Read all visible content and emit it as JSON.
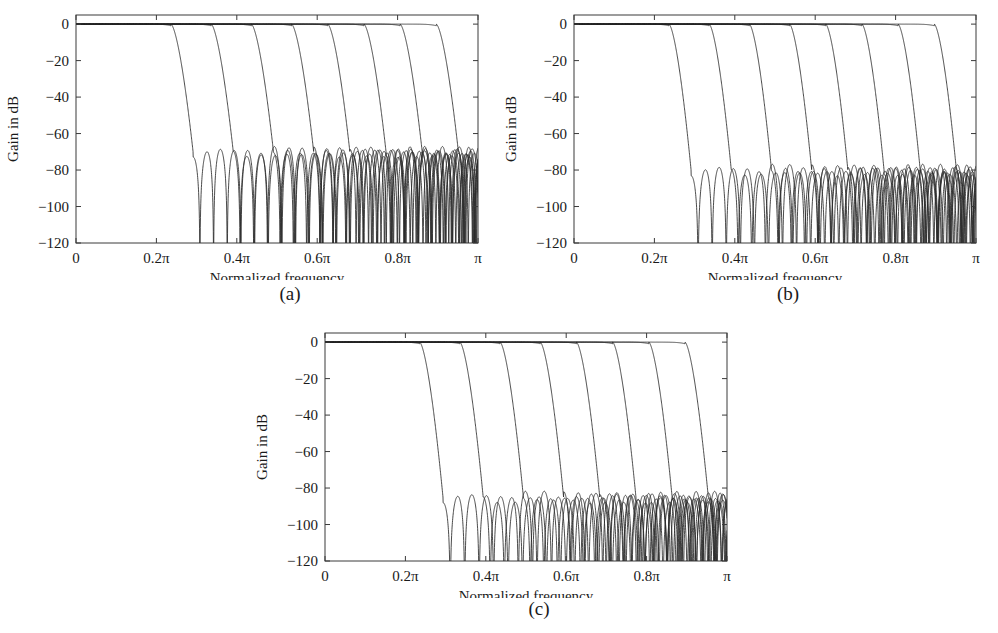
{
  "figure": {
    "background": "#ffffff",
    "line_color": "#2b2b2b",
    "axis_color": "#3a3a3a",
    "panels": [
      {
        "id": "a",
        "caption": "(a)",
        "xlabel": "Normalized frequency",
        "ylabel": "Gain in dB"
      },
      {
        "id": "b",
        "caption": "(b)",
        "xlabel": "Normalized frequency",
        "ylabel": "Gain in dB"
      },
      {
        "id": "c",
        "caption": "(c)",
        "xlabel": "Normalized frequency",
        "ylabel": "Gain in dB"
      }
    ]
  },
  "chart_data": [
    {
      "type": "line",
      "panel": "a",
      "title": "",
      "xlabel": "Normalized frequency",
      "ylabel": "Gain in dB",
      "xlim": [
        0,
        1
      ],
      "ylim": [
        -120,
        5
      ],
      "grid": false,
      "legend": "none",
      "xtick_values": [
        0,
        0.2,
        0.4,
        0.6,
        0.8,
        1.0
      ],
      "xtick_labels": [
        "0",
        "0.2π",
        "0.4π",
        "0.6π",
        "0.8π",
        "π"
      ],
      "ytick_values": [
        0,
        -20,
        -40,
        -60,
        -80,
        -100,
        -120
      ],
      "ytick_labels": [
        "0",
        "−20",
        "−40",
        "−60",
        "−80",
        "−100",
        "−120"
      ],
      "stopband_level_db": -70,
      "passband_level_db": 0,
      "n_series": 8,
      "series": [
        {
          "name": "cutoff 0.25π",
          "cutoff": 0.25,
          "transition": 0.055,
          "stopband_db": -70,
          "ripple_db": 11,
          "lobe_width": 0.034
        },
        {
          "name": "cutoff 0.35π",
          "cutoff": 0.35,
          "transition": 0.055,
          "stopband_db": -70,
          "ripple_db": 11,
          "lobe_width": 0.034
        },
        {
          "name": "cutoff 0.45π",
          "cutoff": 0.45,
          "transition": 0.055,
          "stopband_db": -70,
          "ripple_db": 11,
          "lobe_width": 0.033
        },
        {
          "name": "cutoff 0.55π",
          "cutoff": 0.55,
          "transition": 0.055,
          "stopband_db": -70,
          "ripple_db": 11,
          "lobe_width": 0.032
        },
        {
          "name": "cutoff 0.64π",
          "cutoff": 0.64,
          "transition": 0.055,
          "stopband_db": -70,
          "ripple_db": 11,
          "lobe_width": 0.031
        },
        {
          "name": "cutoff 0.73π",
          "cutoff": 0.73,
          "transition": 0.055,
          "stopband_db": -70,
          "ripple_db": 11,
          "lobe_width": 0.03
        },
        {
          "name": "cutoff 0.82π",
          "cutoff": 0.82,
          "transition": 0.055,
          "stopband_db": -70,
          "ripple_db": 11,
          "lobe_width": 0.029
        },
        {
          "name": "cutoff 0.91π",
          "cutoff": 0.91,
          "transition": 0.055,
          "stopband_db": -70,
          "ripple_db": 11,
          "lobe_width": 0.028
        }
      ]
    },
    {
      "type": "line",
      "panel": "b",
      "title": "",
      "xlabel": "Normalized frequency",
      "ylabel": "Gain in dB",
      "xlim": [
        0,
        1
      ],
      "ylim": [
        -120,
        5
      ],
      "grid": false,
      "legend": "none",
      "xtick_values": [
        0,
        0.2,
        0.4,
        0.6,
        0.8,
        1.0
      ],
      "xtick_labels": [
        "0",
        "0.2π",
        "0.4π",
        "0.6π",
        "0.8π",
        "π"
      ],
      "ytick_values": [
        0,
        -20,
        -40,
        -60,
        -80,
        -100,
        -120
      ],
      "ytick_labels": [
        "0",
        "−20",
        "−40",
        "−60",
        "−80",
        "−100",
        "−120"
      ],
      "stopband_level_db": -80,
      "passband_level_db": 0,
      "n_series": 8,
      "series": [
        {
          "name": "cutoff 0.25π",
          "cutoff": 0.25,
          "transition": 0.055,
          "stopband_db": -80,
          "ripple_db": 12,
          "lobe_width": 0.035
        },
        {
          "name": "cutoff 0.35π",
          "cutoff": 0.35,
          "transition": 0.055,
          "stopband_db": -80,
          "ripple_db": 12,
          "lobe_width": 0.034
        },
        {
          "name": "cutoff 0.45π",
          "cutoff": 0.45,
          "transition": 0.055,
          "stopband_db": -80,
          "ripple_db": 12,
          "lobe_width": 0.033
        },
        {
          "name": "cutoff 0.55π",
          "cutoff": 0.55,
          "transition": 0.055,
          "stopband_db": -80,
          "ripple_db": 12,
          "lobe_width": 0.032
        },
        {
          "name": "cutoff 0.64π",
          "cutoff": 0.64,
          "transition": 0.055,
          "stopband_db": -80,
          "ripple_db": 12,
          "lobe_width": 0.031
        },
        {
          "name": "cutoff 0.73π",
          "cutoff": 0.73,
          "transition": 0.055,
          "stopband_db": -80,
          "ripple_db": 12,
          "lobe_width": 0.03
        },
        {
          "name": "cutoff 0.82π",
          "cutoff": 0.82,
          "transition": 0.055,
          "stopband_db": -80,
          "ripple_db": 12,
          "lobe_width": 0.029
        },
        {
          "name": "cutoff 0.91π",
          "cutoff": 0.91,
          "transition": 0.055,
          "stopband_db": -80,
          "ripple_db": 12,
          "lobe_width": 0.028
        }
      ]
    },
    {
      "type": "line",
      "panel": "c",
      "title": "",
      "xlabel": "Normalized frequency",
      "ylabel": "Gain in dB",
      "xlim": [
        0,
        1
      ],
      "ylim": [
        -120,
        5
      ],
      "grid": false,
      "legend": "none",
      "xtick_values": [
        0,
        0.2,
        0.4,
        0.6,
        0.8,
        1.0
      ],
      "xtick_labels": [
        "0",
        "0.2π",
        "0.4π",
        "0.6π",
        "0.8π",
        "π"
      ],
      "ytick_values": [
        0,
        -20,
        -40,
        -60,
        -80,
        -100,
        -120
      ],
      "ytick_labels": [
        "0",
        "−20",
        "−40",
        "−60",
        "−80",
        "−100",
        "−120"
      ],
      "stopband_level_db": -85,
      "passband_level_db": 0,
      "n_series": 8,
      "series": [
        {
          "name": "cutoff 0.25π",
          "cutoff": 0.25,
          "transition": 0.058,
          "stopband_db": -85,
          "ripple_db": 12,
          "lobe_width": 0.036
        },
        {
          "name": "cutoff 0.35π",
          "cutoff": 0.35,
          "transition": 0.058,
          "stopband_db": -85,
          "ripple_db": 12,
          "lobe_width": 0.035
        },
        {
          "name": "cutoff 0.45π",
          "cutoff": 0.45,
          "transition": 0.058,
          "stopband_db": -85,
          "ripple_db": 12,
          "lobe_width": 0.034
        },
        {
          "name": "cutoff 0.55π",
          "cutoff": 0.55,
          "transition": 0.058,
          "stopband_db": -85,
          "ripple_db": 12,
          "lobe_width": 0.033
        },
        {
          "name": "cutoff 0.64π",
          "cutoff": 0.64,
          "transition": 0.058,
          "stopband_db": -85,
          "ripple_db": 12,
          "lobe_width": 0.032
        },
        {
          "name": "cutoff 0.73π",
          "cutoff": 0.73,
          "transition": 0.058,
          "stopband_db": -85,
          "ripple_db": 12,
          "lobe_width": 0.031
        },
        {
          "name": "cutoff 0.82π",
          "cutoff": 0.82,
          "transition": 0.058,
          "stopband_db": -85,
          "ripple_db": 12,
          "lobe_width": 0.03
        },
        {
          "name": "cutoff 0.91π",
          "cutoff": 0.91,
          "transition": 0.058,
          "stopband_db": -85,
          "ripple_db": 12,
          "lobe_width": 0.029
        }
      ]
    }
  ]
}
